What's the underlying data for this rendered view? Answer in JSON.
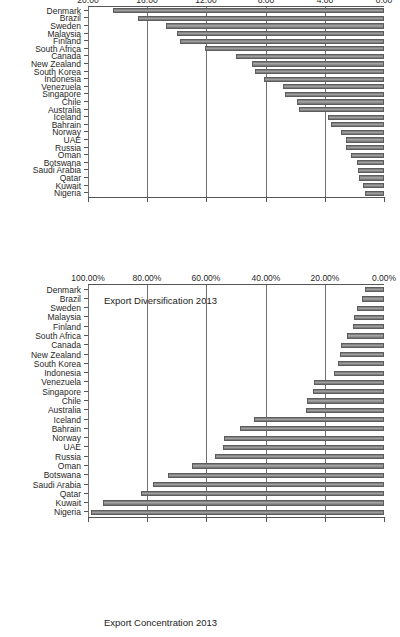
{
  "figure": {
    "orientation": "rotated-90-ccw",
    "background": "#ffffff",
    "bar_color": "#8a8a8a",
    "grid_color": "#6f6f6f"
  },
  "charts": [
    {
      "id": "export-diversification",
      "chart_data": {
        "type": "bar",
        "title": "Export Diversification 2013",
        "xlabel": "",
        "ylabel": "",
        "ylim": [
          0.0,
          20.0
        ],
        "yticks": [
          "0.00",
          "4.00",
          "8.00",
          "12.00",
          "16.00",
          "20.00"
        ],
        "ytick_values": [
          0,
          4,
          8,
          12,
          16,
          20
        ],
        "grid": true,
        "legend": "none",
        "categories": [
          "Nigeria",
          "Kuwait",
          "Qatar",
          "Saudi Arabia",
          "Botswana",
          "Oman",
          "Russia",
          "UAE",
          "Norway",
          "Bahrain",
          "Iceland",
          "Australia",
          "Chile",
          "Singapore",
          "Venezuela",
          "Indonesia",
          "South Korea",
          "New Zealand",
          "Canada",
          "South Africa",
          "Finland",
          "Malaysia",
          "Sweden",
          "Brazil",
          "Denmark"
        ],
        "values": [
          1.3,
          1.45,
          1.7,
          1.75,
          1.85,
          2.25,
          2.55,
          2.6,
          2.9,
          3.6,
          3.8,
          5.75,
          5.85,
          6.7,
          6.8,
          8.1,
          8.7,
          8.95,
          10.0,
          12.1,
          13.8,
          14.0,
          14.7,
          16.6,
          18.3
        ]
      }
    },
    {
      "id": "export-concentration",
      "chart_data": {
        "type": "bar",
        "title": "Export Concentration 2013",
        "xlabel": "",
        "ylabel": "",
        "ylim": [
          0.0,
          100.0
        ],
        "yticks": [
          "0.00%",
          "20.00%",
          "40.00%",
          "60.00%",
          "80.00%",
          "100.00%"
        ],
        "ytick_values": [
          0,
          20,
          40,
          60,
          80,
          100
        ],
        "grid": true,
        "legend": "none",
        "categories": [
          "Nigeria",
          "Kuwait",
          "Qatar",
          "Saudi Arabia",
          "Botswana",
          "Oman",
          "Russia",
          "UAE",
          "Norway",
          "Bahrain",
          "Iceland",
          "Australia",
          "Chile",
          "Singapore",
          "Venezuela",
          "Indonesia",
          "South Korea",
          "New Zealand",
          "Canada",
          "South Africa",
          "Finland",
          "Malaysia",
          "Sweden",
          "Brazil",
          "Denmark"
        ],
        "values": [
          99.0,
          95.0,
          82.0,
          78.0,
          73.0,
          65.0,
          57.0,
          54.5,
          54.0,
          48.5,
          44.0,
          26.5,
          26.0,
          24.0,
          23.5,
          17.0,
          15.5,
          15.0,
          14.5,
          12.5,
          10.5,
          10.0,
          9.0,
          7.5,
          6.5
        ]
      }
    }
  ]
}
